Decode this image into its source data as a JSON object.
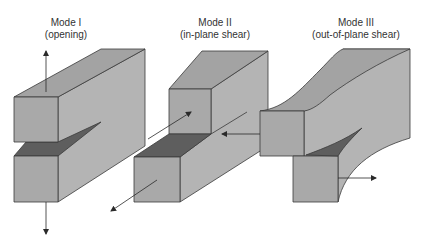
{
  "modes": [
    {
      "title": "Mode I",
      "subtitle": "(opening)"
    },
    {
      "title": "Mode II",
      "subtitle": "(in-plane shear)"
    },
    {
      "title": "Mode III",
      "subtitle": "(out-of-plane shear)"
    }
  ],
  "colors": {
    "face": "#a9a9a9",
    "side": "#b4b4b4",
    "top": "#a3a3a3",
    "crack": "#5e5e5e",
    "edge": "#3a3a3a",
    "arrow": "#2a2a2a"
  }
}
